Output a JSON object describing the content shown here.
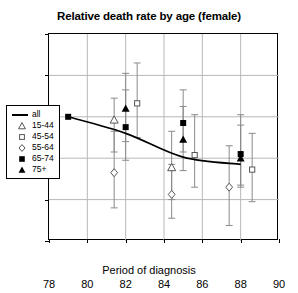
{
  "chart_data": {
    "type": "scatter",
    "title": "Relative death rate by age (female)",
    "xlabel": "Period of diagnosis",
    "ylabel": "Relative rate",
    "xlim": [
      78,
      90
    ],
    "ylim": [
      0.4,
      1.4
    ],
    "xticks": [
      78,
      80,
      82,
      84,
      86,
      88,
      90
    ],
    "yticks": [
      0.4,
      0.6,
      0.8,
      1.0,
      1.2,
      1.4
    ],
    "ytick_labels": [
      "0.4",
      "0.6",
      "0.8",
      "1",
      "1.2",
      "1.4"
    ],
    "grid": "horizontal-and-vertical",
    "legend_position": "inner-left",
    "x": [
      79,
      82,
      85,
      88
    ],
    "series": [
      {
        "name": "all",
        "marker": "line",
        "values": [
          1.0,
          0.92,
          0.805,
          0.77
        ]
      },
      {
        "name": "15-44",
        "marker": "open-triangle",
        "values": [
          null,
          0.985,
          0.755,
          null
        ],
        "err_low": [
          null,
          0.83,
          0.6,
          null
        ],
        "err_high": [
          null,
          1.09,
          0.93,
          null
        ]
      },
      {
        "name": "45-54",
        "marker": "open-square",
        "values": [
          null,
          1.065,
          0.815,
          0.745
        ],
        "err_low": [
          null,
          0.9,
          0.66,
          0.59
        ],
        "err_high": [
          null,
          1.26,
          1.01,
          0.92
        ]
      },
      {
        "name": "55-64",
        "marker": "open-diamond",
        "values": [
          null,
          0.73,
          0.625,
          0.66
        ],
        "err_low": [
          null,
          0.56,
          0.51,
          0.475
        ],
        "err_high": [
          null,
          0.93,
          0.77,
          0.86
        ]
      },
      {
        "name": "65-74",
        "marker": "filled-square",
        "values": [
          1.0,
          0.95,
          0.97,
          0.82
        ],
        "err_low": [
          null,
          0.79,
          0.83,
          0.67
        ],
        "err_high": [
          null,
          1.13,
          1.13,
          1.01
        ]
      },
      {
        "name": "75+",
        "marker": "filled-triangle",
        "values": [
          null,
          1.04,
          0.89,
          0.8
        ],
        "err_low": [
          null,
          0.88,
          0.74,
          0.66
        ],
        "err_high": [
          null,
          1.21,
          1.05,
          0.96
        ]
      }
    ]
  },
  "legend": {
    "items": [
      {
        "label": "all",
        "marker": "line"
      },
      {
        "label": "15-44",
        "marker": "open-triangle"
      },
      {
        "label": "45-54",
        "marker": "open-square"
      },
      {
        "label": "55-64",
        "marker": "open-diamond"
      },
      {
        "label": "65-74",
        "marker": "filled-square"
      },
      {
        "label": "75+",
        "marker": "filled-triangle"
      }
    ]
  },
  "colors": {
    "axis": "#000000",
    "grid": "#b8b8b8",
    "errorbar": "#8a8a8a",
    "marker_fill": "#000000",
    "marker_open_stroke": "#555555",
    "background": "#ffffff"
  }
}
